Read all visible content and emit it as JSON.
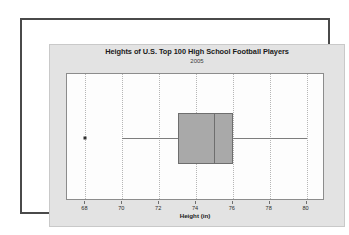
{
  "chart_data": {
    "type": "box",
    "title": "Heights of U.S. Top 100 High School Football Players",
    "subtitle": "2005",
    "xlabel": "Height (in)",
    "ylabel": "",
    "xlim": [
      67,
      81
    ],
    "ticks": [
      68,
      70,
      72,
      74,
      76,
      78,
      80
    ],
    "tick_labels": [
      "68",
      "70",
      "72",
      "74",
      "76",
      "78",
      "80"
    ],
    "grid": "vertical-dotted",
    "legend": "none",
    "series": [
      {
        "name": "Height (in)",
        "min_whisker": 70,
        "q1": 73,
        "median": 75,
        "q3": 76,
        "max_whisker": 80,
        "outliers": [
          68
        ]
      }
    ]
  },
  "colors": {
    "box_fill": "#a9a9a9",
    "box_edge": "#6e6e6e",
    "panel_bg": "#fdfdfd",
    "band_bg": "#e3e3e3",
    "frame": "#4a4a4a",
    "grid": "#b6b6b6",
    "text": "#1a1a1a"
  }
}
